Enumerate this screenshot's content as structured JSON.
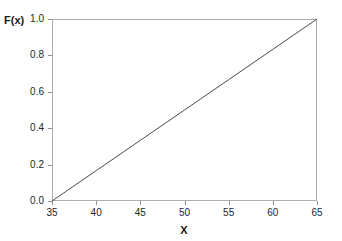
{
  "chart_data": {
    "type": "line",
    "title": "",
    "subtitle": "",
    "xlabel": "X",
    "ylabel": "F(x)",
    "xlim": [
      35,
      65
    ],
    "ylim": [
      0.0,
      1.0
    ],
    "grid": false,
    "legend": null,
    "xticks": [
      35,
      40,
      45,
      50,
      55,
      60,
      65
    ],
    "xtick_labels": [
      "35",
      "40",
      "45",
      "50",
      "55",
      "60",
      "65"
    ],
    "yticks": [
      0.0,
      0.2,
      0.4,
      0.6,
      0.8,
      1.0
    ],
    "ytick_labels": [
      "0.0",
      "0.2",
      "0.4",
      "0.6",
      "0.8",
      "1.0"
    ],
    "series": [
      {
        "name": "F(x)",
        "color": "#4a4a4a",
        "linewidth": 1,
        "x": [
          35,
          40,
          45,
          50,
          55,
          60,
          65
        ],
        "values": [
          0.0,
          0.1667,
          0.3333,
          0.5,
          0.6667,
          0.8333,
          1.0
        ]
      }
    ],
    "annotations": [],
    "frame_color": "#aeaeae",
    "background": "#ffffff"
  }
}
